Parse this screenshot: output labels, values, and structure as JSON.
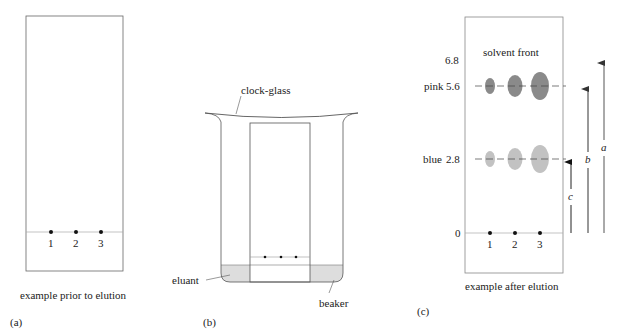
{
  "panels": {
    "a": {
      "tag": "(a)",
      "caption": "example prior to elution",
      "spots": [
        "1",
        "2",
        "3"
      ]
    },
    "b": {
      "tag": "(b)",
      "labels": {
        "clock_glass": "clock-glass",
        "eluant": "eluant",
        "beaker": "beaker"
      }
    },
    "c": {
      "tag": "(c)",
      "caption": "example after elution",
      "solvent_front_label": "solvent front",
      "axis": {
        "top": "6.8",
        "pink_name": "pink",
        "pink_value": "5.6",
        "blue_name": "blue",
        "blue_value": "2.8",
        "zero": "0"
      },
      "spots": [
        "1",
        "2",
        "3"
      ],
      "arrows": {
        "a": "a",
        "b": "b",
        "c": "c"
      },
      "colors": {
        "pink_spot": "#8a8a8a",
        "blue_spot": "#c2c2c2"
      }
    }
  },
  "colors": {
    "eluant_fill": "#dddddd",
    "line": "#555555",
    "baseline": "#999999"
  }
}
